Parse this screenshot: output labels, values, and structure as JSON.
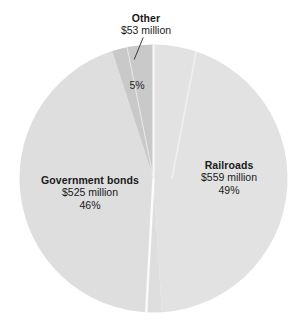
{
  "chart_data": {
    "type": "pie",
    "title": "",
    "subtitle": "",
    "xlabel": "",
    "ylabel": "",
    "legend_position": "none",
    "grid": false,
    "units": "$ million",
    "categories": [
      "Railroads",
      "Government bonds",
      "Other"
    ],
    "values": [
      559,
      525,
      53
    ],
    "percents": [
      49,
      46,
      5
    ],
    "total": 1137,
    "slices": [
      {
        "name": "Railroads",
        "label": "Railroads",
        "value_text": "$559 million",
        "percent_text": "49%",
        "value": 559,
        "percent": 49,
        "color": "#e2e2e2"
      },
      {
        "name": "Government bonds",
        "label": "Government bonds",
        "value_text": "$525 million",
        "percent_text": "46%",
        "value": 525,
        "percent": 46,
        "color": "#dedede"
      },
      {
        "name": "Other",
        "label": "Other",
        "value_text": "$53 million",
        "percent_text": "5%",
        "value": 53,
        "percent": 5,
        "color": "#c9c9c9"
      }
    ],
    "start_angle_deg": 0,
    "direction": "clockwise",
    "colors": {
      "background": "#ffffff",
      "railroads": "#e2e2e2",
      "government_bonds": "#dedede",
      "other": "#c9c9c9",
      "divider": "#f6f6f6",
      "text": "#1a1a1a",
      "leader_line": "#3a3a3a"
    }
  },
  "labels": {
    "other": {
      "title": "Other",
      "value": "$53 million",
      "percent": "5%"
    },
    "railroads": {
      "title": "Railroads",
      "value": "$559 million",
      "percent": "49%"
    },
    "government_bonds": {
      "title": "Government bonds",
      "value": "$525 million",
      "percent": "46%"
    }
  }
}
